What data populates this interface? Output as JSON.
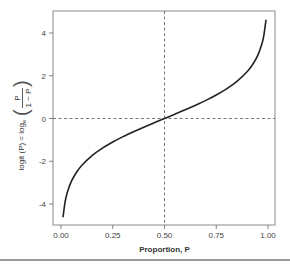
{
  "chart_data": {
    "type": "line",
    "title": "",
    "xlabel": "Proportion, P",
    "ylabel": "logit (P) = log_e (P / (1 − P))",
    "ylabel_parts": {
      "prefix": "logit (P) = log",
      "subscript": "e",
      "numerator": "P",
      "denominator": "1 − P"
    },
    "xlim": [
      0,
      1
    ],
    "ylim": [
      -5,
      5
    ],
    "x_ticks": [
      0.0,
      0.25,
      0.5,
      0.75,
      1.0
    ],
    "x_tick_labels": [
      "0.00",
      "0.25",
      "0.50",
      "0.75",
      "1.00"
    ],
    "y_ticks": [
      -4,
      -2,
      0,
      2,
      4
    ],
    "y_tick_labels": [
      "-4",
      "-2",
      "0",
      "2",
      "4"
    ],
    "grid": false,
    "reference_lines": [
      {
        "orientation": "vertical",
        "x": 0.5,
        "style": "dashed"
      },
      {
        "orientation": "horizontal",
        "y": 0,
        "style": "dashed"
      }
    ],
    "series": [
      {
        "name": "logit(P)",
        "x": [
          0.01,
          0.02,
          0.03,
          0.05,
          0.075,
          0.1,
          0.15,
          0.2,
          0.25,
          0.3,
          0.35,
          0.4,
          0.45,
          0.5,
          0.55,
          0.6,
          0.65,
          0.7,
          0.75,
          0.8,
          0.85,
          0.9,
          0.925,
          0.95,
          0.97,
          0.98,
          0.99
        ],
        "values": [
          -4.595,
          -3.892,
          -3.476,
          -2.944,
          -2.512,
          -2.197,
          -1.735,
          -1.386,
          -1.099,
          -0.847,
          -0.619,
          -0.405,
          -0.201,
          0.0,
          0.201,
          0.405,
          0.619,
          0.847,
          1.099,
          1.386,
          1.735,
          2.197,
          2.512,
          2.944,
          3.476,
          3.892,
          4.595
        ]
      }
    ],
    "colors": {
      "line": "#222222",
      "axis": "#888888",
      "reference": "#555555"
    }
  }
}
